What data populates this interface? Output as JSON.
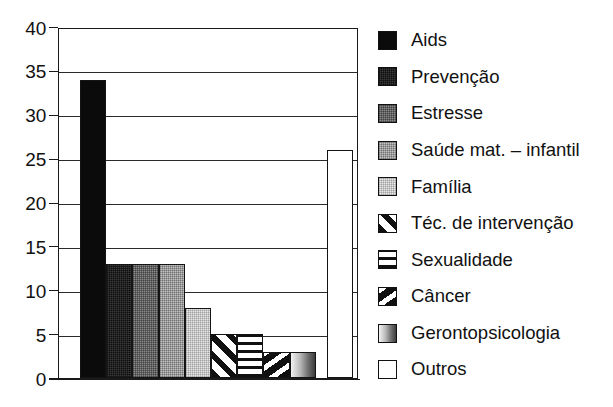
{
  "chart_data": {
    "type": "bar",
    "title": "",
    "xlabel": "",
    "ylabel": "",
    "ylim": [
      0,
      40
    ],
    "ytick_step": 5,
    "yticks": [
      "40",
      "35",
      "30",
      "25",
      "20",
      "15",
      "10",
      "5",
      "0"
    ],
    "grid": true,
    "legend_position": "right",
    "categories": [
      "Aids",
      "Prevenção",
      "Estresse",
      "Saúde mat. – infantil",
      "Família",
      "Téc. de intervenção",
      "Sexualidade",
      "Câncer",
      "Gerontopsicologia",
      "Outros"
    ],
    "values": [
      34,
      13,
      13,
      13,
      8,
      5,
      5,
      3,
      3,
      26
    ],
    "series": [
      {
        "name": "Temas",
        "values": [
          34,
          13,
          13,
          13,
          8,
          5,
          5,
          3,
          3,
          26
        ]
      }
    ],
    "bars": [
      {
        "label": "Aids",
        "value": 34,
        "fill": "solid-black",
        "swatch": "solid-black"
      },
      {
        "label": "Prevenção",
        "value": 13,
        "fill": "grey-dark",
        "swatch": "grey-dark"
      },
      {
        "label": "Estresse",
        "value": 13,
        "fill": "grey-mid",
        "swatch": "grey-mid"
      },
      {
        "label": "Saúde mat. – infantil",
        "value": 13,
        "fill": "grey-light",
        "swatch": "grey-light"
      },
      {
        "label": "Família",
        "value": 8,
        "fill": "grey-vlight",
        "swatch": "grey-vlight"
      },
      {
        "label": "Téc. de intervenção",
        "value": 5,
        "fill": "diag-stripe",
        "swatch": "diag-stripe"
      },
      {
        "label": "Sexualidade",
        "value": 5,
        "fill": "crosshatch",
        "swatch": "crosshatch"
      },
      {
        "label": "Câncer",
        "value": 3,
        "fill": "diag-thick",
        "swatch": "diag-thick"
      },
      {
        "label": "Gerontopsicologia",
        "value": 3,
        "fill": "gradient-h",
        "swatch": "gradient-h"
      },
      {
        "label": "Outros",
        "value": 26,
        "fill": "white",
        "swatch": "white"
      }
    ]
  },
  "colors": {
    "axis": "#1a1a1a",
    "grid": "#2b2b2b",
    "text": "#111111",
    "background": "#ffffff"
  }
}
